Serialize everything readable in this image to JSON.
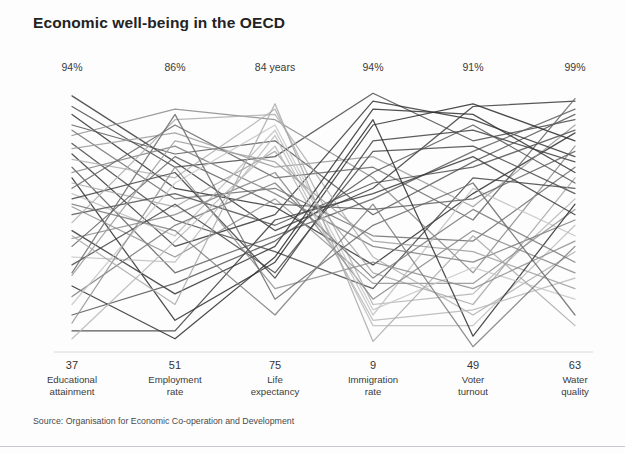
{
  "header": {
    "title": "Economic well-being in the OECD"
  },
  "footer": {
    "source": "Source: Organisation for Economic Co-operation and Development"
  },
  "chart_data": {
    "type": "line",
    "subtype": "parallel-coordinates",
    "title": "Economic well-being in the OECD",
    "xlabel": "",
    "ylabel": "",
    "grid": false,
    "legend": "none",
    "source": "Source: Organisation for Economic Co-operation and Development",
    "axes": [
      {
        "name": "Educational attainment",
        "label_line1": "Educational",
        "label_line2": "attainment",
        "top_label": "94%",
        "bottom_label": "37",
        "min": 37,
        "max": 94,
        "unit": "%",
        "x": 72
      },
      {
        "name": "Employment rate",
        "label_line1": "Employment",
        "label_line2": "rate",
        "top_label": "86%",
        "bottom_label": "51",
        "min": 51,
        "max": 86,
        "unit": "%",
        "x": 175
      },
      {
        "name": "Life expectancy",
        "label_line1": "Life",
        "label_line2": "expectancy",
        "top_label": "84 years",
        "bottom_label": "75",
        "min": 75,
        "max": 84,
        "unit": "years",
        "x": 275
      },
      {
        "name": "Immigration rate",
        "label_line1": "Immigration",
        "label_line2": "rate",
        "top_label": "94%",
        "bottom_label": "9",
        "min": 9,
        "max": 94,
        "unit": "%",
        "x": 373
      },
      {
        "name": "Voter turnout",
        "label_line1": "Voter",
        "label_line2": "turnout",
        "top_label": "91%",
        "bottom_label": "49",
        "min": 49,
        "max": 91,
        "unit": "%",
        "x": 473
      },
      {
        "name": "Water quality",
        "label_line1": "Water",
        "label_line2": "quality",
        "top_label": "99%",
        "bottom_label": "63",
        "min": 63,
        "max": 99,
        "unit": "%",
        "x": 575
      }
    ],
    "value_encoding": "Each series value is a normalised position on its axis, 0 = axis bottom label, 1 = axis top label.",
    "series": [
      {
        "name": "country-01",
        "shade": "#3a3a3a",
        "values": [
          0.97,
          0.72,
          0.46,
          0.62,
          0.93,
          0.95
        ]
      },
      {
        "name": "country-02",
        "shade": "#4a4a4a",
        "values": [
          0.93,
          0.7,
          0.74,
          0.98,
          0.8,
          0.88
        ]
      },
      {
        "name": "country-03",
        "shade": "#2e2e2e",
        "values": [
          0.9,
          0.62,
          0.55,
          0.33,
          0.6,
          0.83
        ]
      },
      {
        "name": "country-04",
        "shade": "#575757",
        "values": [
          0.86,
          0.75,
          0.8,
          0.52,
          0.72,
          0.9
        ]
      },
      {
        "name": "country-05",
        "shade": "#6d6d6d",
        "values": [
          0.84,
          0.58,
          0.62,
          0.44,
          0.42,
          0.7
        ]
      },
      {
        "name": "country-06",
        "shade": "#8a8a8a",
        "values": [
          0.82,
          0.92,
          0.88,
          0.66,
          0.3,
          0.78
        ]
      },
      {
        "name": "country-07",
        "shade": "#444444",
        "values": [
          0.79,
          0.5,
          0.38,
          0.24,
          0.66,
          0.62
        ]
      },
      {
        "name": "country-08",
        "shade": "#9b9b9b",
        "values": [
          0.77,
          0.83,
          0.7,
          0.74,
          0.55,
          0.86
        ]
      },
      {
        "name": "country-09",
        "shade": "#353535",
        "values": [
          0.75,
          0.4,
          0.52,
          0.95,
          0.88,
          0.74
        ]
      },
      {
        "name": "country-10",
        "shade": "#b0b0b0",
        "values": [
          0.73,
          0.66,
          0.92,
          0.18,
          0.22,
          0.58
        ]
      },
      {
        "name": "country-11",
        "shade": "#5e5e5e",
        "values": [
          0.7,
          0.3,
          0.44,
          0.58,
          0.76,
          0.92
        ]
      },
      {
        "name": "country-12",
        "shade": "#7d7d7d",
        "values": [
          0.68,
          0.78,
          0.6,
          0.4,
          0.34,
          0.5
        ]
      },
      {
        "name": "country-13",
        "shade": "#2a2a2a",
        "values": [
          0.66,
          0.12,
          0.34,
          0.86,
          0.94,
          0.8
        ]
      },
      {
        "name": "country-14",
        "shade": "#a4a4a4",
        "values": [
          0.64,
          0.55,
          0.76,
          0.3,
          0.18,
          0.66
        ]
      },
      {
        "name": "country-15",
        "shade": "#666666",
        "values": [
          0.62,
          0.86,
          0.66,
          0.7,
          0.5,
          0.96
        ]
      },
      {
        "name": "country-16",
        "shade": "#c0c0c0",
        "values": [
          0.6,
          0.44,
          0.84,
          0.14,
          0.62,
          0.44
        ]
      },
      {
        "name": "country-17",
        "shade": "#3f3f3f",
        "values": [
          0.58,
          0.68,
          0.28,
          0.8,
          0.84,
          0.72
        ]
      },
      {
        "name": "country-18",
        "shade": "#919191",
        "values": [
          0.55,
          0.36,
          0.58,
          0.26,
          0.26,
          0.54
        ]
      },
      {
        "name": "country-19",
        "shade": "#505050",
        "values": [
          0.52,
          0.6,
          0.48,
          0.64,
          0.7,
          0.84
        ]
      },
      {
        "name": "country-20",
        "shade": "#aeaeae",
        "values": [
          0.49,
          0.88,
          0.9,
          0.36,
          0.14,
          0.38
        ]
      },
      {
        "name": "country-21",
        "shade": "#313131",
        "values": [
          0.46,
          0.22,
          0.4,
          0.92,
          0.9,
          0.68
        ]
      },
      {
        "name": "country-22",
        "shade": "#868686",
        "values": [
          0.43,
          0.52,
          0.68,
          0.2,
          0.46,
          0.3
        ]
      },
      {
        "name": "country-23",
        "shade": "#606060",
        "values": [
          0.4,
          0.74,
          0.56,
          0.54,
          0.58,
          0.76
        ]
      },
      {
        "name": "country-24",
        "shade": "#bcbcbc",
        "values": [
          0.36,
          0.34,
          0.82,
          0.1,
          0.1,
          0.48
        ]
      },
      {
        "name": "country-25",
        "shade": "#474747",
        "values": [
          0.33,
          0.56,
          0.3,
          0.76,
          0.78,
          0.6
        ]
      },
      {
        "name": "country-26",
        "shade": "#9e9e9e",
        "values": [
          0.29,
          0.8,
          0.72,
          0.42,
          0.38,
          0.24
        ]
      },
      {
        "name": "country-27",
        "shade": "#2c2c2c",
        "values": [
          0.25,
          0.05,
          0.36,
          0.88,
          0.06,
          0.56
        ]
      },
      {
        "name": "country-28",
        "shade": "#787878",
        "values": [
          0.21,
          0.48,
          0.64,
          0.28,
          0.54,
          0.34
        ]
      },
      {
        "name": "country-29",
        "shade": "#c6c6c6",
        "values": [
          0.18,
          0.64,
          0.86,
          0.16,
          0.32,
          0.2
        ]
      },
      {
        "name": "country-30",
        "shade": "#545454",
        "values": [
          0.14,
          0.26,
          0.42,
          0.68,
          0.86,
          0.64
        ]
      },
      {
        "name": "country-31",
        "shade": "#8e8e8e",
        "values": [
          0.11,
          0.7,
          0.24,
          0.34,
          0.24,
          0.42
        ]
      },
      {
        "name": "country-32",
        "shade": "#3c3c3c",
        "values": [
          0.08,
          0.08,
          0.5,
          0.6,
          0.74,
          0.52
        ]
      },
      {
        "name": "country-33",
        "shade": "#b6b6b6",
        "values": [
          0.05,
          0.42,
          0.78,
          0.12,
          0.16,
          0.28
        ]
      },
      {
        "name": "country-34",
        "shade": "#6a6a6a",
        "values": [
          0.3,
          0.9,
          0.2,
          0.48,
          0.64,
          0.14
        ]
      },
      {
        "name": "country-35",
        "shade": "#a8a8a8",
        "values": [
          0.44,
          0.18,
          0.94,
          0.04,
          0.44,
          0.1
        ]
      },
      {
        "name": "country-36",
        "shade": "#7a7a7a",
        "values": [
          0.56,
          0.46,
          0.14,
          0.56,
          0.02,
          0.4
        ]
      }
    ],
    "plot_geometry": {
      "top_y": 36,
      "bottom_y": 300,
      "svg_width": 625,
      "svg_height": 305
    }
  }
}
